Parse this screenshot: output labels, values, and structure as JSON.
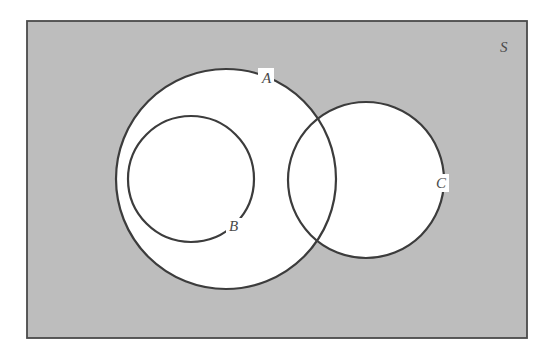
{
  "diagram": {
    "type": "venn",
    "universe": {
      "label": "S",
      "x": 27,
      "y": 21,
      "width": 500,
      "height": 317,
      "fill": "#bdbdbd"
    },
    "sets": [
      {
        "id": "A",
        "label": "A",
        "cx": 226,
        "cy": 179,
        "r": 110,
        "label_x": 264,
        "label_y": 83
      },
      {
        "id": "B",
        "label": "B",
        "cx": 191,
        "cy": 179,
        "r": 63,
        "label_x": 230,
        "label_y": 231
      },
      {
        "id": "C",
        "label": "C",
        "cx": 366,
        "cy": 180,
        "r": 78,
        "label_x": 437,
        "label_y": 188
      }
    ],
    "relations": [
      "B is a subset of A",
      "A and C overlap",
      "B and C are disjoint"
    ],
    "stroke_color": "#3c3c3c",
    "fill_inside": "#ffffff"
  }
}
